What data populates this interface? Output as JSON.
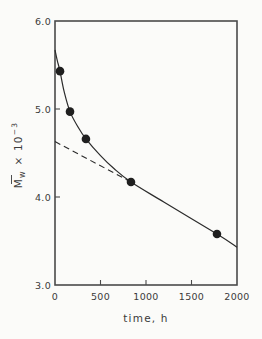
{
  "chart_data": {
    "type": "line",
    "title": "",
    "xlabel": "time, h",
    "ylabel": "M̄w × 10⁻³",
    "ylabel_parts": {
      "main": "M",
      "sub": "w",
      "mult": " × 10",
      "exp": "−3"
    },
    "xlim": [
      0,
      2000
    ],
    "ylim": [
      3.0,
      6.0
    ],
    "grid": false,
    "legend": null,
    "x_ticks": [
      0,
      500,
      1000,
      1500,
      2000
    ],
    "x_tick_labels": [
      "0",
      "500",
      "1000",
      "1500",
      "2000"
    ],
    "y_ticks": [
      3.0,
      4.0,
      5.0,
      6.0
    ],
    "y_tick_labels": [
      "3.0",
      "4.0",
      "5.0",
      "6.0"
    ],
    "series": [
      {
        "name": "measured",
        "style": "markers",
        "marker": "filled-circle",
        "x": [
          55,
          165,
          340,
          835,
          1780
        ],
        "y": [
          5.43,
          4.97,
          4.66,
          4.17,
          3.58
        ]
      },
      {
        "name": "fitted-curve",
        "style": "solid-line",
        "x": [
          0,
          25,
          55,
          100,
          165,
          250,
          340,
          500,
          650,
          835,
          1200,
          1780,
          2000
        ],
        "y": [
          5.67,
          5.55,
          5.43,
          5.2,
          4.97,
          4.8,
          4.66,
          4.47,
          4.32,
          4.17,
          3.94,
          3.58,
          3.43
        ]
      },
      {
        "name": "linear-extrapolation",
        "style": "dashed-line",
        "x": [
          0,
          835
        ],
        "y": [
          4.63,
          4.17
        ]
      }
    ]
  }
}
